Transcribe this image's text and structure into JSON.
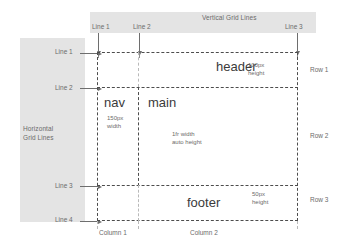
{
  "diagram": {
    "vertical_panel": {
      "title": "Vertical Grid Lines",
      "lines": [
        {
          "label": "Line 1"
        },
        {
          "label": "Line 2"
        },
        {
          "label": "Line 3"
        }
      ]
    },
    "horizontal_panel": {
      "title_line1": "Horizontal",
      "title_line2": "Grid Lines",
      "lines": [
        {
          "label": "Line 1"
        },
        {
          "label": "Line 2"
        },
        {
          "label": "Line 3"
        },
        {
          "label": "Line 4"
        }
      ]
    },
    "areas": [
      {
        "name": "header",
        "note_line1": "100px",
        "note_line2": "height"
      },
      {
        "name": "nav",
        "note_line1": "150px",
        "note_line2": "width"
      },
      {
        "name": "main",
        "note_line1": "1fr width",
        "note_line2": "auto height"
      },
      {
        "name": "footer",
        "note_line1": "50px",
        "note_line2": "height"
      }
    ],
    "rows": [
      {
        "label": "Row 1"
      },
      {
        "label": "Row 2"
      },
      {
        "label": "Row 3"
      }
    ],
    "columns": [
      {
        "label": "Column 1"
      },
      {
        "label": "Column 2"
      }
    ],
    "colors": {
      "panel_fill": "#e4e4e4",
      "grid_line": "#4d4d4d",
      "faint_line": "#b9b9b9",
      "text": "#6b6b6b",
      "area_text": "#3b3b3b",
      "background": "#ffffff"
    }
  }
}
